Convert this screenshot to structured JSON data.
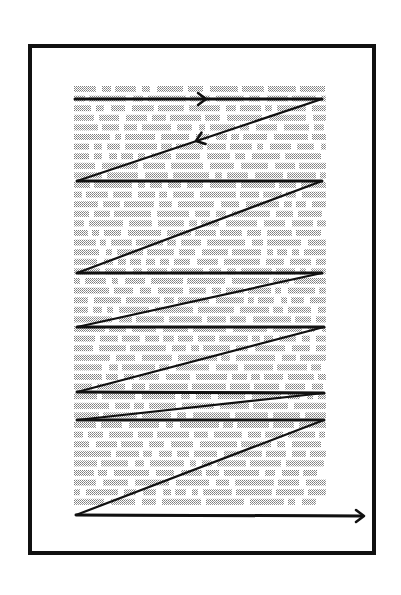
{
  "diagram": {
    "colors": {
      "frame": "#111111",
      "path": "#111111",
      "text_dots": "#8a8a8a",
      "background": "#ffffff"
    },
    "frame": {
      "x": 30,
      "y": 46,
      "width": 344,
      "height": 507
    },
    "text_block": {
      "x": 74,
      "y": 86,
      "width": 252,
      "height": 428,
      "line_spacing": 9.6
    },
    "path_points": [
      [
        75,
        99
      ],
      [
        322,
        99
      ],
      [
        77,
        181
      ],
      [
        322,
        181
      ],
      [
        77,
        273
      ],
      [
        322,
        273
      ],
      [
        77,
        327
      ],
      [
        324,
        327
      ],
      [
        77,
        392
      ],
      [
        324,
        393
      ],
      [
        77,
        420
      ],
      [
        324,
        420
      ],
      [
        76,
        515
      ],
      [
        362,
        516
      ]
    ],
    "arrowheads": [
      {
        "name": "first-line-arrow",
        "x": 206,
        "y": 99,
        "direction": "right"
      },
      {
        "name": "return-diagonal-arrow",
        "x": 196,
        "y": 141,
        "direction": "down-left"
      },
      {
        "name": "exit-arrow",
        "x": 364,
        "y": 516,
        "direction": "right"
      }
    ]
  }
}
